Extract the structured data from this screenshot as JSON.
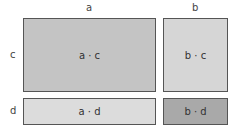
{
  "labels": {
    "col_a": "a",
    "col_b": "b",
    "row_c": "c",
    "row_d": "d"
  },
  "cells": {
    "ac": {
      "text": "a · c",
      "color": "#c4c4c4"
    },
    "bc": {
      "text": "b · c",
      "color": "#d6d6d6"
    },
    "ad": {
      "text": "a · d",
      "color": "#dcdcdc"
    },
    "bd": {
      "text": "b · d",
      "color": "#a9a9a9"
    }
  }
}
